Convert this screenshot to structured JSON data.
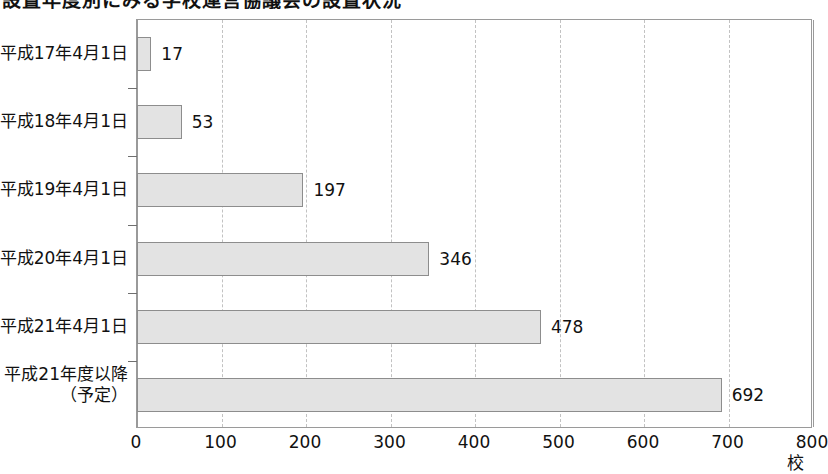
{
  "title": {
    "text": "設置年度別にみる学校運営協議会の設置状況",
    "clipped": true
  },
  "chart_data": {
    "type": "bar",
    "orientation": "horizontal",
    "title": "設置年度別にみる学校運営協議会の設置状況",
    "categories": [
      "平成17年4月1日",
      "平成18年4月1日",
      "平成19年4月1日",
      "平成20年4月1日",
      "平成21年4月1日",
      "平成21年度以降"
    ],
    "category_sublabels": [
      "",
      "",
      "",
      "",
      "",
      "（予定）"
    ],
    "values": [
      17,
      53,
      197,
      346,
      478,
      692
    ],
    "value_labels": [
      "17",
      "53",
      "197",
      "346",
      "478",
      "692"
    ],
    "xlabel": "",
    "ylabel": "",
    "unit": "校",
    "xlim": [
      0,
      800
    ],
    "xticks": [
      0,
      100,
      200,
      300,
      400,
      500,
      600,
      700,
      800
    ],
    "xtick_labels": [
      "0",
      "100",
      "200",
      "300",
      "400",
      "500",
      "600",
      "700",
      "800"
    ],
    "grid": "vertical-dashed",
    "legend": "none",
    "bar_fill": "#e3e3e3",
    "bar_border": "#8d8d8d",
    "grid_color": "#c2c2c2",
    "axis_color": "#9a9a9a"
  }
}
